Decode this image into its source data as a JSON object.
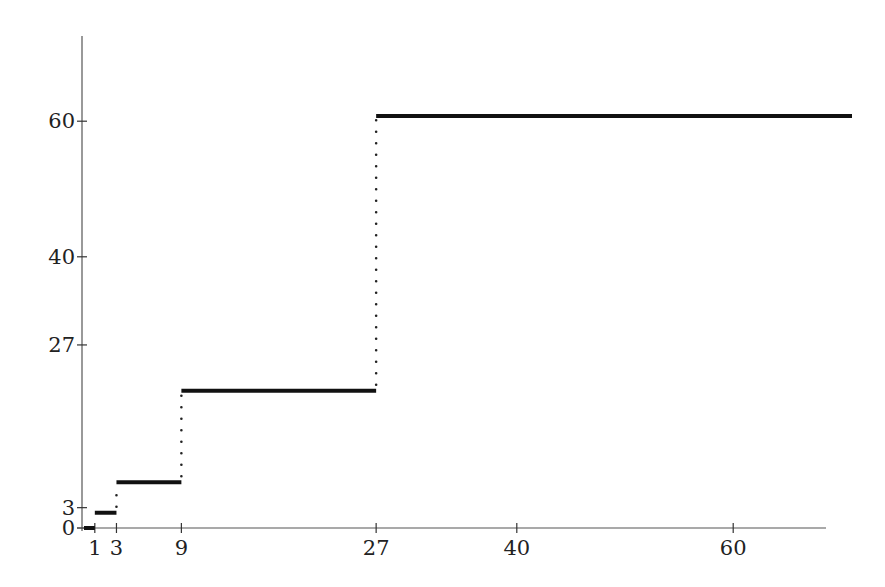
{
  "chart_data": {
    "type": "line",
    "subtype": "step",
    "title": "",
    "xlabel": "",
    "ylabel": "",
    "xlim": [
      0,
      68
    ],
    "ylim": [
      0,
      72
    ],
    "grid": false,
    "legend": null,
    "x_ticks": [
      1,
      3,
      9,
      27,
      40,
      60
    ],
    "y_ticks": [
      0,
      3,
      27,
      40,
      60
    ],
    "segments": [
      {
        "x_start": 0,
        "x_end": 1,
        "y": 0
      },
      {
        "x_start": 1,
        "x_end": 3,
        "y": 2.25
      },
      {
        "x_start": 3,
        "x_end": 9,
        "y": 6.75
      },
      {
        "x_start": 9,
        "x_end": 27,
        "y": 20.25
      },
      {
        "x_start": 27,
        "x_end": 71,
        "y": 60.75
      }
    ],
    "jumps": [
      {
        "x": 3,
        "y_from": 2.25,
        "y_to": 6.75
      },
      {
        "x": 9,
        "y_from": 6.75,
        "y_to": 20.25
      },
      {
        "x": 27,
        "y_from": 20.25,
        "y_to": 60.75
      }
    ],
    "segment_style": "solid thick",
    "jump_style": "dotted",
    "colors": {
      "line": "#111111",
      "axis": "#555555",
      "text": "#222222"
    }
  },
  "layout": {
    "origin_px": [
      84,
      528
    ],
    "x_px_per_unit": 10.82,
    "y_px_per_unit": 6.78,
    "x_axis_end_px": 826,
    "y_axis_top_px": 36
  }
}
